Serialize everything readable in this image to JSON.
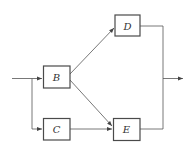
{
  "diagram": {
    "type": "block-diagram",
    "blocks": [
      {
        "id": "B",
        "label": "B"
      },
      {
        "id": "C",
        "label": "C"
      },
      {
        "id": "D",
        "label": "D"
      },
      {
        "id": "E",
        "label": "E"
      }
    ],
    "edges": [
      {
        "from": "input",
        "to": "B"
      },
      {
        "from": "input",
        "to": "C"
      },
      {
        "from": "B",
        "to": "D"
      },
      {
        "from": "B",
        "to": "E"
      },
      {
        "from": "C",
        "to": "E"
      },
      {
        "from": "D",
        "to": "output"
      },
      {
        "from": "E",
        "to": "output"
      }
    ],
    "colors": {
      "stroke": "#4a4a4a",
      "background": "#ffffff"
    }
  }
}
